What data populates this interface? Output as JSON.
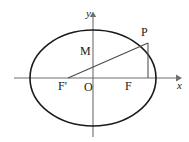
{
  "figure": {
    "type": "geometry-diagram",
    "background_color": "#ffffff",
    "stroke_color": "#1a1a1a",
    "axis_color": "#6e6e6e",
    "width": 189,
    "height": 142
  },
  "axes": {
    "x_label": "x",
    "y_label": "y",
    "origin_label": "O",
    "x_axis": {
      "start_x": 14,
      "end_x": 180,
      "y": 78,
      "arrow": "right"
    },
    "y_axis": {
      "x": 93,
      "start_y": 14,
      "end_y": 137,
      "arrow": "up"
    }
  },
  "ellipse": {
    "center_x": 93,
    "center_y": 78,
    "semi_major_a": 63,
    "semi_minor_b": 48
  },
  "points": [
    {
      "name": "P",
      "label": "P",
      "x": 148,
      "y": 43,
      "on": "ellipse"
    },
    {
      "name": "M",
      "label": "M",
      "x": 93,
      "y": 57,
      "on": "y-axis"
    },
    {
      "name": "F2",
      "label": "F",
      "x": 133,
      "y": 78,
      "on": "x-axis",
      "role": "right-focus"
    },
    {
      "name": "F1",
      "label": "F'",
      "x": 68,
      "y": 78,
      "on": "x-axis",
      "role": "left-focus"
    },
    {
      "name": "O",
      "label": "O",
      "x": 93,
      "y": 78,
      "role": "origin"
    }
  ],
  "segments": [
    {
      "name": "focal-chord-F1P",
      "from": "F'",
      "to": "P",
      "x1": 68,
      "y1": 78,
      "x2": 148,
      "y2": 43
    },
    {
      "name": "perpendicular-PF",
      "from": "P",
      "to": "F",
      "x1": 148,
      "y1": 43,
      "x2": 148,
      "y2": 78
    }
  ],
  "icons": {
    "x_axis_arrow": "arrow-right-icon",
    "y_axis_arrow": "arrow-up-icon"
  }
}
